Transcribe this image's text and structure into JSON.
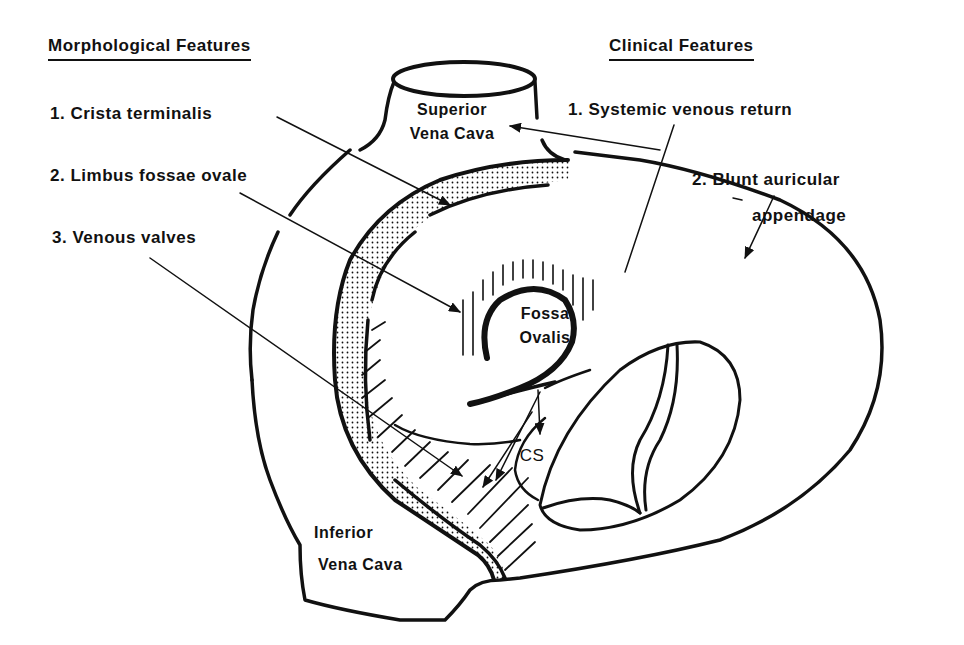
{
  "diagram": {
    "colors": {
      "ink": "#111111",
      "background": "#ffffff"
    }
  },
  "left_panel": {
    "heading": "Morphological Features",
    "items": [
      {
        "num": "1.",
        "label": "Crista terminalis"
      },
      {
        "num": "2.",
        "label": "Limbus fossae ovale"
      },
      {
        "num": "3.",
        "label": "Venous valves"
      }
    ]
  },
  "right_panel": {
    "heading": "Clinical Features",
    "items": [
      {
        "num": "1.",
        "label": "Systemic venous return"
      },
      {
        "num": "2.",
        "label": "Blunt auricular",
        "label2": "appendage"
      }
    ]
  },
  "structures": {
    "svc_line1": "Superior",
    "svc_line2": "Vena Cava",
    "fossa_line1": "Fossa",
    "fossa_line2": "Ovalis",
    "cs": "CS",
    "ivc_line1": "Inferior",
    "ivc_line2": "Vena Cava"
  }
}
